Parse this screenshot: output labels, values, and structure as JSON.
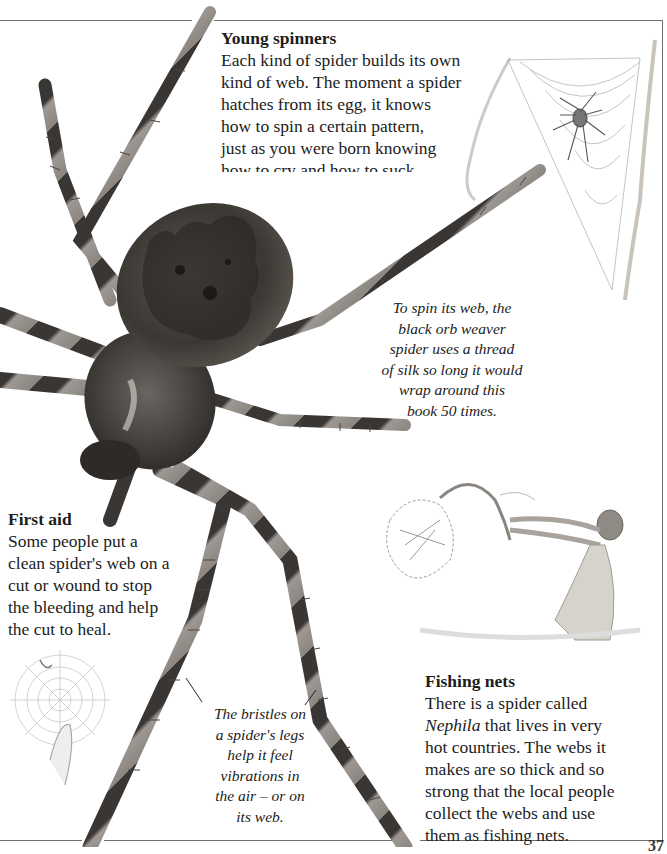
{
  "page": {
    "page_number": "37",
    "colors": {
      "rule": "#6f6f6f",
      "text": "#1c1c1c",
      "background": "#ffffff"
    }
  },
  "sections": {
    "young_spinners": {
      "heading": "Young spinners",
      "lines": [
        "Each kind of spider builds its own",
        "kind of web. The moment a spider",
        "hatches from its egg, it knows",
        "how to spin a certain pattern,",
        "just as you were born knowing",
        "how to cry and how to suck."
      ]
    },
    "first_aid": {
      "heading": "First aid",
      "lines": [
        "Some people put a",
        "clean spider's web on a",
        "cut or wound to stop",
        "the bleeding and help",
        "the cut to heal."
      ]
    },
    "fishing_nets": {
      "heading": "Fishing nets",
      "lines": [
        "There is a spider called",
        "Nephila that lives in very",
        "hot countries. The webs it",
        "makes are so thick and so",
        "strong that the local people",
        "collect the webs and use",
        "them as fishing nets."
      ],
      "italic_word": "Nephila",
      "line1_rest": " that lives in very"
    }
  },
  "captions": {
    "orb_weaver": {
      "lines": [
        "To spin its web, the",
        "black orb weaver",
        "spider uses a thread",
        "of silk so long it would",
        "wrap around this",
        "book 50 times."
      ]
    },
    "bristles": {
      "lines": [
        "The bristles on",
        "a spider's legs",
        "help it feel",
        "vibrations in",
        "the air – or on",
        "its web."
      ]
    }
  },
  "images": {
    "main_photo": "black-orb-weaver-spider-photo",
    "web_illustration": "spider-in-triangular-web-between-twigs",
    "fishing_illustration": "boy-swinging-web-fishing-net",
    "first_aid_illustration": "finger-touching-orb-web"
  }
}
